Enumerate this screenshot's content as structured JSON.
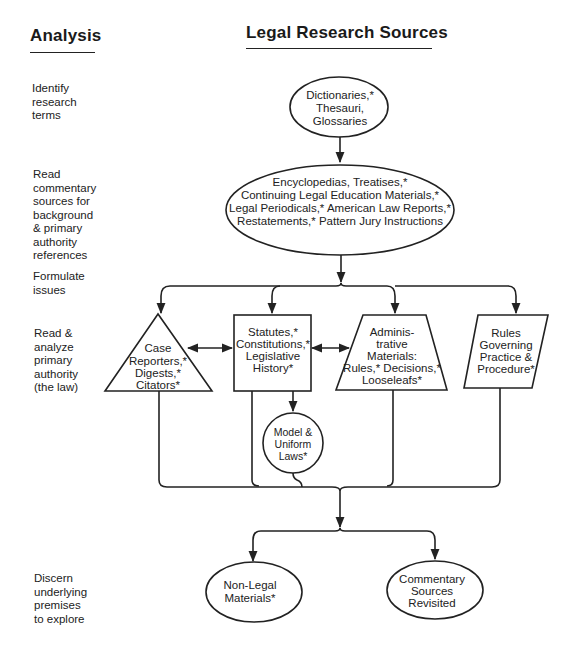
{
  "headings": {
    "left": "Analysis",
    "right": "Legal Research Sources"
  },
  "analysis_steps": [
    {
      "lines": [
        "Identify",
        "research",
        "terms"
      ]
    },
    {
      "lines": [
        "Read",
        "commentary",
        "sources for",
        "background",
        "& primary",
        "authority",
        "references"
      ]
    },
    {
      "lines": [
        "Formulate",
        "issues"
      ]
    },
    {
      "lines": [
        "Read &",
        "analyze",
        "primary",
        "authority",
        "(the law)"
      ]
    },
    {
      "lines": [
        "Discern",
        "underlying",
        "premises",
        "to explore"
      ]
    }
  ],
  "nodes": {
    "dictionaries": {
      "shape": "ellipse",
      "lines": [
        "Dictionaries,*",
        "Thesauri,",
        "Glossaries"
      ]
    },
    "commentary": {
      "shape": "ellipse",
      "lines": [
        "Encyclopedias, Treatises,*",
        "Continuing Legal Education Materials,*",
        "Legal Periodicals,* American Law Reports,*",
        "Restatements,* Pattern Jury Instructions"
      ]
    },
    "case_reporters": {
      "shape": "triangle",
      "lines": [
        "Case",
        "Reporters,*",
        "Digests,*",
        "Citators*"
      ]
    },
    "statutes": {
      "shape": "rectangle",
      "lines": [
        "Statutes,*",
        "Constitutions,*",
        "Legislative",
        "History*"
      ]
    },
    "administrative": {
      "shape": "trapezoid",
      "lines": [
        "Adminis-",
        "trative",
        "Materials:",
        "Rules,* Decisions,*",
        "Looseleafs*"
      ]
    },
    "rules": {
      "shape": "parallelogram",
      "lines": [
        "Rules",
        "Governing",
        "Practice &",
        "Procedure*"
      ]
    },
    "model_laws": {
      "shape": "circle",
      "lines": [
        "Model &",
        "Uniform",
        "Laws*"
      ]
    },
    "non_legal": {
      "shape": "ellipse",
      "lines": [
        "Non-Legal",
        "Materials*"
      ]
    },
    "commentary_revisited": {
      "shape": "ellipse",
      "lines": [
        "Commentary",
        "Sources",
        "Revisited"
      ]
    }
  },
  "colors": {
    "ink": "#222222",
    "background": "#ffffff"
  }
}
